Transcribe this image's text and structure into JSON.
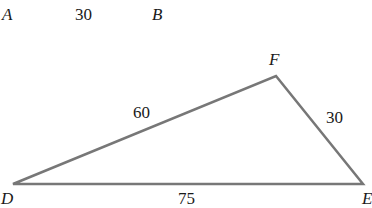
{
  "segment_ab": {
    "start_label": "A",
    "end_label": "B",
    "length": "30"
  },
  "triangle": {
    "vertices": {
      "D": {
        "label": "D",
        "x": 13,
        "y": 184
      },
      "F": {
        "label": "F",
        "x": 276,
        "y": 76
      },
      "E": {
        "label": "E",
        "x": 363,
        "y": 184
      }
    },
    "sides": {
      "DF": "60",
      "FE": "30",
      "DE": "75"
    },
    "stroke_color": "#777777"
  }
}
